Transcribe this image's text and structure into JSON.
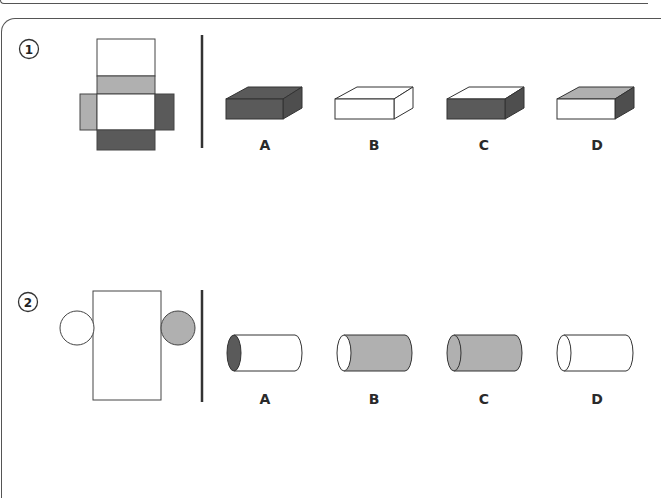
{
  "colors": {
    "white": "#ffffff",
    "light_gray": "#b0b0b0",
    "dark_gray": "#5a5a5a",
    "stroke": "#333333"
  },
  "problems": [
    {
      "number": "1",
      "net": "box net: top white, light gray strip, white center, left light gray flap, right dark flap, bottom dark strip",
      "options": [
        {
          "label": "A",
          "description": "cuboid all dark"
        },
        {
          "label": "B",
          "description": "cuboid all white"
        },
        {
          "label": "C",
          "description": "cuboid white top, dark front and side"
        },
        {
          "label": "D",
          "description": "cuboid light gray top, white front, dark side"
        }
      ]
    },
    {
      "number": "2",
      "net": "cylinder net: white rectangle, white left circle, gray right circle",
      "options": [
        {
          "label": "A",
          "description": "white cylinder, dark end"
        },
        {
          "label": "B",
          "description": "gray cylinder, white end"
        },
        {
          "label": "C",
          "description": "gray cylinder, gray end"
        },
        {
          "label": "D",
          "description": "white cylinder, white end"
        }
      ]
    }
  ]
}
